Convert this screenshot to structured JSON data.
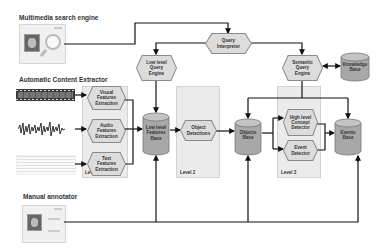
{
  "sections": {
    "search_engine": "Multimedia search engine",
    "content_extractor": "Automatic Content Extractor",
    "manual_annotator": "Manual annotator"
  },
  "levels": {
    "level1": "Level 1",
    "level2": "Level 2",
    "level3": "Level 3"
  },
  "processes": {
    "query_interpreter": [
      "Query",
      "Interpreter"
    ],
    "low_level_query_engine": [
      "Low level",
      "Query",
      "Engine"
    ],
    "semantic_query_engine": [
      "Semantic",
      "Query",
      "Engine"
    ],
    "visual_features": [
      "Visual",
      "Features",
      "Extraction"
    ],
    "audio_features": [
      "Audio",
      "Features",
      "Extraction"
    ],
    "text_features": [
      "Text",
      "Features",
      "Extraction"
    ],
    "object_detections": [
      "Object",
      "Detections"
    ],
    "high_level_concept": [
      "High level",
      "Concept",
      "Detector"
    ],
    "event_detector": [
      "Event",
      "Detector"
    ]
  },
  "databases": {
    "low_level_features_base": [
      "Low level",
      "Features",
      "Base"
    ],
    "objects_base": [
      "Objects",
      "Base"
    ],
    "events_base": [
      "Events",
      "Base"
    ],
    "knowledge_base": [
      "Knowledge",
      "Base"
    ]
  },
  "colors": {
    "panel": "#ebebeb",
    "hex_fill": "#dcdcdc",
    "db_fill": "#a8a8a8",
    "line": "#111111"
  }
}
